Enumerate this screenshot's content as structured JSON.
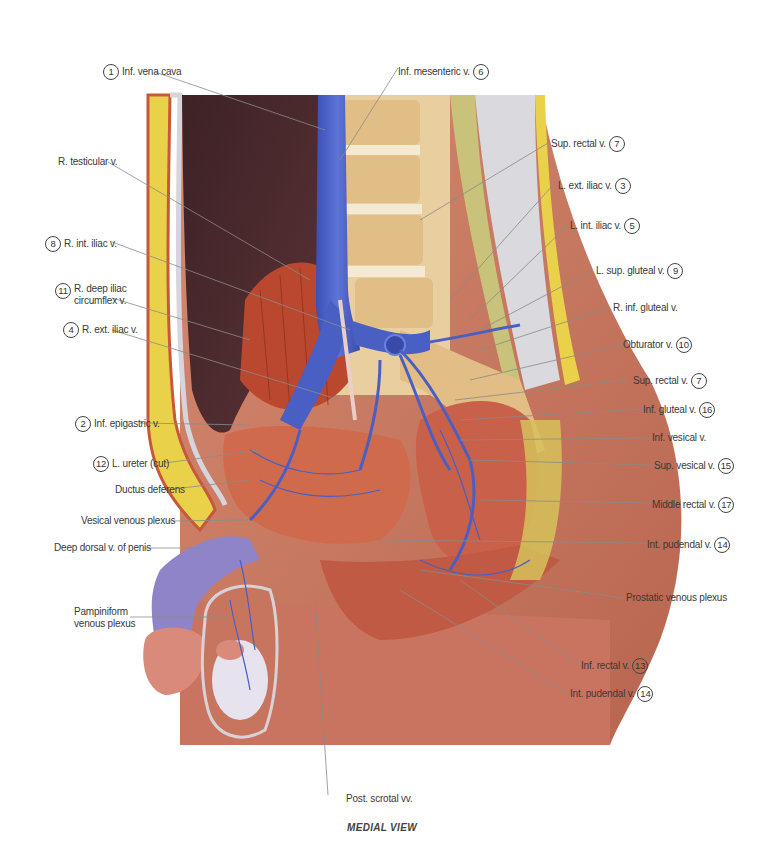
{
  "figure": {
    "caption": "MEDIAL VIEW",
    "colors": {
      "vein": "#4a5fc4",
      "muscle": "#c8583c",
      "skin": "#c97a62",
      "fat": "#e9d24a",
      "bone": "#e9cfa0",
      "cavity": "#4a2a2e",
      "leader_line": "#8a8a8a"
    }
  },
  "labels": {
    "inf_vena_cava": {
      "number": "1",
      "text": "Inf. vena cava"
    },
    "inf_mesenteric": {
      "number": "6",
      "text": "Inf. mesenteric v."
    },
    "r_testicular": {
      "number": "",
      "text": "R. testicular v."
    },
    "r_int_iliac": {
      "number": "8",
      "text": "R. int. iliac v."
    },
    "r_deep_iliac": {
      "number": "11",
      "line1": "R. deep iliac",
      "line2": "circumflex v."
    },
    "r_ext_iliac": {
      "number": "4",
      "text": "R. ext. iliac v."
    },
    "inf_epigastric": {
      "number": "2",
      "text": "Inf. epigastric v."
    },
    "l_ureter": {
      "number": "12",
      "text": "L. ureter (cut)"
    },
    "ductus_deferens": {
      "number": "",
      "text": "Ductus deferens"
    },
    "vesical_plexus": {
      "number": "",
      "text": "Vesical venous plexus"
    },
    "deep_dorsal": {
      "number": "",
      "text": "Deep dorsal v. of penis"
    },
    "pampiniform": {
      "number": "",
      "line1": "Pampiniform",
      "line2": "venous plexus"
    },
    "post_scrotal": {
      "number": "",
      "text": "Post. scrotal vv."
    },
    "sup_rectal_top": {
      "number": "7",
      "text": "Sup. rectal v."
    },
    "l_ext_iliac": {
      "number": "3",
      "text": "L. ext. iliac v."
    },
    "l_int_iliac": {
      "number": "5",
      "text": "L. int. iliac v."
    },
    "l_sup_gluteal": {
      "number": "9",
      "text": "L. sup. gluteal v."
    },
    "r_inf_gluteal": {
      "number": "",
      "text": "R. inf. gluteal v."
    },
    "obturator": {
      "number": "10",
      "text": "Obturator v."
    },
    "sup_rectal_mid": {
      "number": "7",
      "text": "Sup. rectal v."
    },
    "inf_gluteal": {
      "number": "16",
      "text": "Inf. gluteal v."
    },
    "inf_vesical": {
      "number": "",
      "text": "Inf. vesical v."
    },
    "sup_vesical": {
      "number": "15",
      "text": "Sup. vesical v."
    },
    "middle_rectal": {
      "number": "17",
      "text": "Middle rectal v."
    },
    "int_pudendal_top": {
      "number": "14",
      "text": "Int. pudendal v."
    },
    "prostatic_plexus": {
      "number": "",
      "text": "Prostatic venous plexus"
    },
    "inf_rectal": {
      "number": "13",
      "text": "Inf. rectal v."
    },
    "int_pudendal_bottom": {
      "number": "14",
      "text": "Int. pudendal v."
    }
  }
}
